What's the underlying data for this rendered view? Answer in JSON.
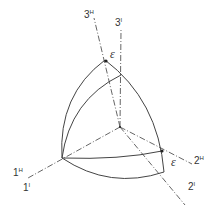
{
  "diagram": {
    "type": "spherical-triangle-axes",
    "axis_labels": [
      {
        "id": "3H",
        "base": "3",
        "sup": "H"
      },
      {
        "id": "3I",
        "base": "3",
        "sup": "I"
      },
      {
        "id": "1H",
        "base": "1",
        "sup": "H"
      },
      {
        "id": "1I",
        "base": "1",
        "sup": "I"
      },
      {
        "id": "2H",
        "base": "2",
        "sup": "H"
      },
      {
        "id": "2I",
        "base": "2",
        "sup": "I"
      }
    ],
    "angle_labels": [
      {
        "id": "eps-top",
        "text": "ε"
      },
      {
        "id": "eps-right",
        "text": "ε"
      }
    ],
    "stroke_color": "#444444"
  }
}
